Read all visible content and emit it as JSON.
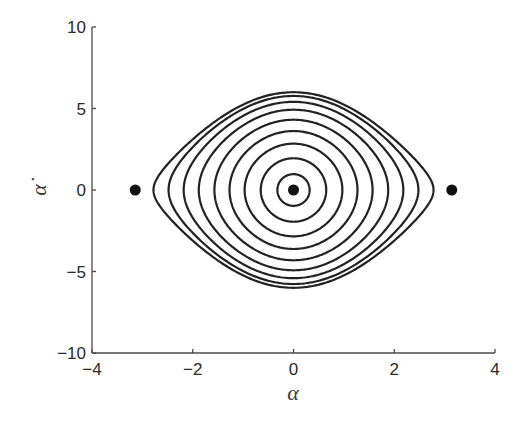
{
  "chart_data": {
    "type": "line",
    "title": "",
    "subtitle": "",
    "xlabel": "α",
    "ylabel": "α̇",
    "xlim": [
      -4,
      4
    ],
    "ylim": [
      -10,
      10
    ],
    "xticks": [
      -4,
      -2,
      0,
      2,
      4
    ],
    "xtick_labels": [
      "−4",
      "−2",
      "0",
      "2",
      "4"
    ],
    "yticks": [
      -10,
      -5,
      0,
      5,
      10
    ],
    "ytick_labels": [
      "−10",
      "−5",
      "0",
      "5",
      "10"
    ],
    "grid": false,
    "legend": null,
    "omega": 3.05,
    "series": [
      {
        "name": "orbit 1",
        "amplitude_alpha": 0.32,
        "max_alpha_dot": 0.97
      },
      {
        "name": "orbit 2",
        "amplitude_alpha": 0.65,
        "max_alpha_dot": 1.97
      },
      {
        "name": "orbit 3",
        "amplitude_alpha": 0.97,
        "max_alpha_dot": 2.86
      },
      {
        "name": "orbit 4",
        "amplitude_alpha": 1.27,
        "max_alpha_dot": 3.62
      },
      {
        "name": "orbit 5",
        "amplitude_alpha": 1.57,
        "max_alpha_dot": 4.31
      },
      {
        "name": "orbit 6",
        "amplitude_alpha": 1.88,
        "max_alpha_dot": 4.91
      },
      {
        "name": "orbit 7",
        "amplitude_alpha": 2.18,
        "max_alpha_dot": 5.39
      },
      {
        "name": "orbit 8",
        "amplitude_alpha": 2.48,
        "max_alpha_dot": 5.76
      },
      {
        "name": "orbit 9",
        "amplitude_alpha": 2.78,
        "max_alpha_dot": 6.0
      }
    ],
    "equilibrium_points": [
      {
        "alpha": -3.1416,
        "alpha_dot": 0
      },
      {
        "alpha": 0,
        "alpha_dot": 0
      },
      {
        "alpha": 3.1416,
        "alpha_dot": 0
      }
    ]
  },
  "colors": {
    "orbit": "#222222",
    "axis": "#4a4a4a",
    "point": "#111111",
    "background": "#ffffff"
  }
}
